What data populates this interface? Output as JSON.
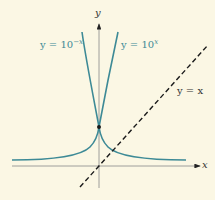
{
  "diagram": {
    "axes": {
      "x_label": "x",
      "y_label": "y"
    },
    "curves": [
      {
        "name": "exp-growth",
        "label_prefix": "y = 10",
        "label_exp": "x",
        "color": "#3d8a96"
      },
      {
        "name": "exp-decay",
        "label_prefix": "y = 10",
        "label_exp": "−x",
        "color": "#3d8a96"
      }
    ],
    "line": {
      "label": "y = x",
      "style": "dashed",
      "color": "#1a1a1a"
    },
    "intersection_point": {
      "x": 0,
      "y": 1
    }
  },
  "colors": {
    "background": "#fbf7e4",
    "curve": "#3d8a96",
    "axis": "#777777",
    "dashed_line": "#1a1a1a"
  }
}
